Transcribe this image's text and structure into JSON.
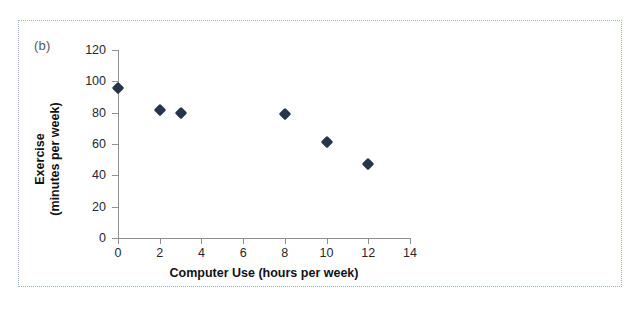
{
  "figure": {
    "panel_label": "(b)",
    "frame_style": "dotted"
  },
  "chart_data": {
    "type": "scatter",
    "title": "",
    "subtitle": "",
    "xlabel": "Computer Use (hours per week)",
    "ylabel": "Exercise (minutes per week)",
    "ylabel_line1": "Exercise",
    "ylabel_line2": "(minutes per week)",
    "xlim": [
      0,
      14
    ],
    "ylim": [
      0,
      120
    ],
    "xticks": [
      0,
      2,
      4,
      6,
      8,
      10,
      12,
      14
    ],
    "yticks": [
      0,
      20,
      40,
      60,
      80,
      100,
      120
    ],
    "grid": false,
    "legend": null,
    "marker": "diamond",
    "marker_color": "#25354c",
    "axis_color": "#8d8f92",
    "points": [
      {
        "x": 0,
        "y": 96
      },
      {
        "x": 2,
        "y": 82
      },
      {
        "x": 3,
        "y": 80
      },
      {
        "x": 8,
        "y": 79
      },
      {
        "x": 10,
        "y": 61
      },
      {
        "x": 12,
        "y": 47
      }
    ],
    "series": [
      {
        "name": "Exercise vs Computer Use",
        "x": [
          0,
          2,
          3,
          8,
          10,
          12
        ],
        "values": [
          96,
          82,
          80,
          79,
          61,
          47
        ]
      }
    ]
  }
}
